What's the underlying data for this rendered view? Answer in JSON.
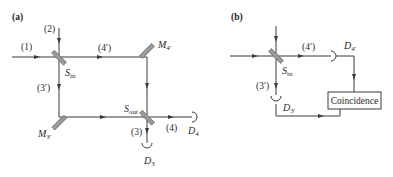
{
  "panel_a": {
    "label": "(a)",
    "ports": {
      "in1": "(1)",
      "in2": "(2)",
      "arm4p": "(4′)",
      "arm3p": "(3′)",
      "out4": "(4)",
      "out3": "(3)"
    },
    "components": {
      "splitter_in": {
        "main": "S",
        "sub": "in"
      },
      "splitter_out": {
        "main": "S",
        "sub": "out"
      },
      "mirror_4p": {
        "main": "M",
        "sub": "4′"
      },
      "mirror_3p": {
        "main": "M",
        "sub": "3′"
      },
      "detector_4": {
        "main": "D",
        "sub": "4"
      },
      "detector_3": {
        "main": "D",
        "sub": "3"
      }
    }
  },
  "panel_b": {
    "label": "(b)",
    "ports": {
      "arm4p": "(4′)",
      "arm3p": "(3′)"
    },
    "components": {
      "splitter_in": {
        "main": "S",
        "sub": "in"
      },
      "detector_4p": {
        "main": "D",
        "sub": "4′"
      },
      "detector_3p": {
        "main": "D",
        "sub": "3′"
      }
    },
    "coincidence_box": "Coincidence"
  }
}
